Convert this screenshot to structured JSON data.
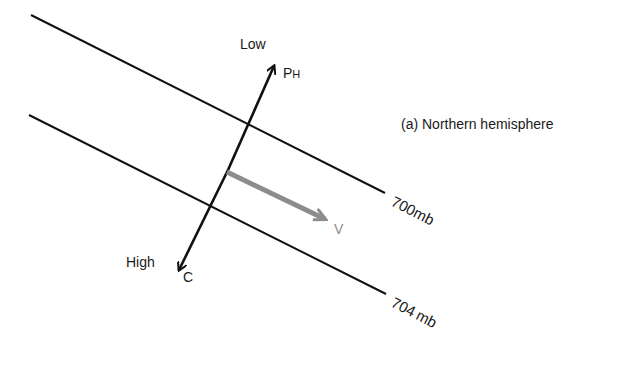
{
  "diagram": {
    "caption": "(a) Northern hemisphere",
    "isobars": [
      {
        "label_num": "700",
        "label_unit": "mb",
        "x1": 31,
        "y1": 15,
        "x2": 385,
        "y2": 193
      },
      {
        "label_num": "704",
        "label_unit": "mb",
        "x1": 29,
        "y1": 115,
        "x2": 386,
        "y2": 294
      }
    ],
    "pressure_axis": {
      "low_label": "Low",
      "high_label": "High",
      "pressure_force_label_main": "P",
      "pressure_force_label_sub": "H",
      "coriolis_label": "C"
    },
    "wind_vector": {
      "label": "V",
      "color": "#8c8c8c"
    },
    "line_color": "#111111"
  }
}
